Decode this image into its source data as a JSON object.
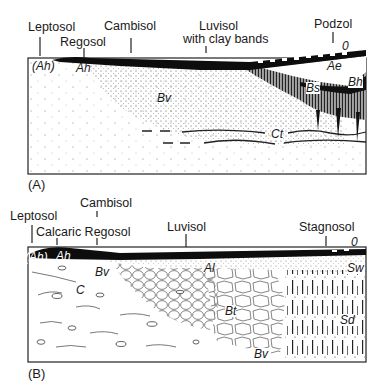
{
  "panel_a": {
    "label": "(A)",
    "soils": [
      {
        "name": "Leptosol"
      },
      {
        "name": "Regosol"
      },
      {
        "name": "Cambisol"
      },
      {
        "name": "Luvisol"
      },
      {
        "name": "with clay bands"
      },
      {
        "name": "Podzol"
      }
    ],
    "horizons": {
      "ah_paren": "(Ah)",
      "ah": "Ah",
      "bv": "Bv",
      "o": "0",
      "ae": "Ae",
      "bh": "Bh",
      "bs": "Bs",
      "ct": "Ct"
    }
  },
  "panel_b": {
    "label": "(B)",
    "soils": [
      {
        "name": "Leptosol"
      },
      {
        "name": "Calcaric Regosol"
      },
      {
        "name": "Cambisol"
      },
      {
        "name": "Luvisol"
      },
      {
        "name": "Stagnosol"
      }
    ],
    "horizons": {
      "ah_paren": "(Ah)",
      "ah": "Ah",
      "bv": "Bv",
      "c": "C",
      "al": "Al",
      "bt": "Bt",
      "bv2": "Bv",
      "o": "0",
      "sw": "Sw",
      "sd": "Sd"
    }
  }
}
